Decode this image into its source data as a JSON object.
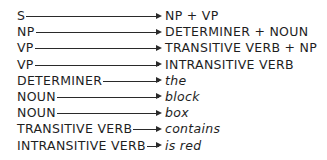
{
  "grammar": {
    "rules": [
      {
        "lhs": "S",
        "rhs": "NP + VP",
        "terminal": false
      },
      {
        "lhs": "NP",
        "rhs": "DETERMINER + NOUN",
        "terminal": false
      },
      {
        "lhs": "VP",
        "rhs": "TRANSITIVE VERB + NP",
        "terminal": false
      },
      {
        "lhs": "VP",
        "rhs": "INTRANSITIVE VERB",
        "terminal": false
      },
      {
        "lhs": "DETERMINER",
        "rhs": "the",
        "terminal": true
      },
      {
        "lhs": "NOUN",
        "rhs": "block",
        "terminal": true
      },
      {
        "lhs": "NOUN",
        "rhs": "box",
        "terminal": true
      },
      {
        "lhs": "TRANSITIVE VERB",
        "rhs": "contains",
        "terminal": true
      },
      {
        "lhs": "INTRANSITIVE VERB",
        "rhs": "is red",
        "terminal": true
      }
    ]
  }
}
